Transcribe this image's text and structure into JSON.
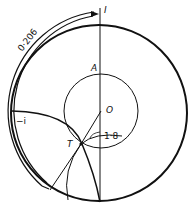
{
  "diagram": {
    "labels": {
      "top": "I",
      "arc_length": "0·206",
      "point_a": "A",
      "point_o": "O",
      "point_t": "T",
      "minus_i": "−i",
      "radius": "1·8"
    },
    "colors": {
      "stroke": "#111111",
      "background": "#ffffff"
    }
  }
}
